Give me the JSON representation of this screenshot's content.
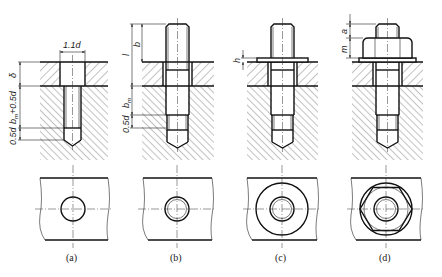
{
  "figure": {
    "stroke_color": "#111111",
    "background": "#ffffff",
    "views": [
      {
        "id": "a",
        "caption": "(a)",
        "dimensions": {
          "hole_width": "1.1d",
          "plate_thickness": "δ",
          "thread_depth": "b",
          "thread_depth_sub": "m",
          "thread_depth_suffix": "+0.5d",
          "drill_extra": "0.5d"
        }
      },
      {
        "id": "b",
        "caption": "(b)",
        "dimensions": {
          "stud_length": "l",
          "projection": "b",
          "engage_length": "b",
          "engage_length_sub": "m",
          "extra": "0.5d"
        }
      },
      {
        "id": "c",
        "caption": "(c)",
        "dimensions": {
          "washer_thickness": "h"
        }
      },
      {
        "id": "d",
        "caption": "(d)",
        "dimensions": {
          "end_projection": "a",
          "nut_height": "m"
        }
      }
    ]
  }
}
